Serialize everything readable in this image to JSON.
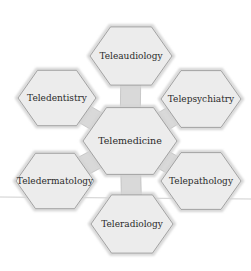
{
  "diagram": {
    "center": {
      "label": "Telemedicine",
      "cx": 130,
      "cy": 141,
      "r": 47
    },
    "nodes": [
      {
        "id": "teleaudiology",
        "label": "Teleaudiology",
        "cx": 131,
        "cy": 56,
        "r": 41
      },
      {
        "id": "telepsychiatry",
        "label": "Telepsychiatry",
        "cx": 201,
        "cy": 99,
        "r": 40
      },
      {
        "id": "telepathology",
        "label": "Telepathology",
        "cx": 201,
        "cy": 181,
        "r": 40
      },
      {
        "id": "teleradiology",
        "label": "Teleradiology",
        "cx": 132,
        "cy": 224,
        "r": 41
      },
      {
        "id": "teledermatology",
        "label": "Teledermatology",
        "cx": 55,
        "cy": 181,
        "r": 39
      },
      {
        "id": "teledentistry",
        "label": "Teledentistry",
        "cx": 57,
        "cy": 98,
        "r": 39
      }
    ],
    "colors": {
      "fill": "#ececec",
      "stroke": "#9a9a9a",
      "connector": "#d9d9d9",
      "text": "#2a2a2a",
      "background": "#ffffff"
    }
  }
}
